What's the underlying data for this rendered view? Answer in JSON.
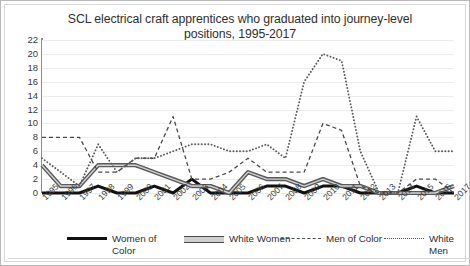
{
  "chart_data": {
    "type": "line",
    "title": "SCL electrical craft apprentices who graduated into journey-level positions, 1995-2017",
    "xlabel": "",
    "ylabel": "",
    "ylim": [
      0,
      22
    ],
    "ytick_step": 2,
    "yticks": [
      "22",
      "20",
      "18",
      "16",
      "14",
      "12",
      "10",
      "8",
      "6",
      "4",
      "2",
      "0"
    ],
    "grid": true,
    "legend_position": "bottom",
    "categories": [
      "1995",
      "1996",
      "1997",
      "1998",
      "1999",
      "2000",
      "2001",
      "2002",
      "2003",
      "2004",
      "2005",
      "2006",
      "2007",
      "2008",
      "2009",
      "2010",
      "2011",
      "2012",
      "2013",
      "2014",
      "2015",
      "2016",
      "2017"
    ],
    "series": [
      {
        "name": "Women of Color",
        "style": "solid-thick",
        "color": "#111111",
        "values": [
          0,
          0,
          0,
          1,
          0,
          0,
          1,
          0,
          2,
          0,
          0,
          0,
          1,
          1,
          0,
          1,
          1,
          0,
          0,
          0,
          1,
          0,
          0
        ]
      },
      {
        "name": "White Women",
        "style": "double",
        "color": "#5a5a5a",
        "values": [
          4,
          1,
          1,
          4,
          4,
          4,
          3,
          2,
          1,
          1,
          0,
          3,
          2,
          2,
          1,
          2,
          1,
          1,
          0,
          0,
          0,
          0,
          1
        ]
      },
      {
        "name": "Men of Color",
        "style": "dashed",
        "color": "#4a4a4a",
        "values": [
          8,
          8,
          8,
          3,
          3,
          5,
          5,
          11,
          2,
          2,
          3,
          5,
          3,
          3,
          3,
          10,
          9,
          1,
          0,
          0,
          2,
          2,
          0
        ]
      },
      {
        "name": "White Men",
        "style": "dotted",
        "color": "#5a5a5a",
        "values": [
          5,
          3,
          1,
          7,
          3,
          5,
          5,
          6,
          7,
          7,
          6,
          6,
          7,
          5,
          16,
          20,
          19,
          6,
          0,
          0,
          11,
          6,
          6
        ]
      }
    ]
  },
  "legend": {
    "items": [
      {
        "label": "Women of Color",
        "mark": "solid-line-swatch"
      },
      {
        "label": "White Women",
        "mark": "double-line-swatch"
      },
      {
        "label": "Men of Color",
        "mark": "dashed-line-swatch"
      },
      {
        "label": "White Men",
        "mark": "dotted-line-swatch"
      }
    ]
  }
}
